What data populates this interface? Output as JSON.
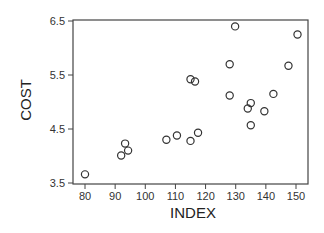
{
  "chart_data": {
    "type": "scatter",
    "title": "",
    "xlabel": "INDEX",
    "ylabel": "COST",
    "xlim": [
      76.5,
      154
    ],
    "ylim": [
      3.5,
      6.5
    ],
    "xticks": [
      80,
      90,
      100,
      110,
      120,
      130,
      140,
      150
    ],
    "yticks": [
      3.5,
      4.5,
      5.5,
      6.5
    ],
    "xtick_labels": [
      "80",
      "90",
      "100",
      "110",
      "120",
      "130",
      "140",
      "150"
    ],
    "ytick_labels": [
      "3.5",
      "4.5",
      "5.5",
      "6.5"
    ],
    "grid": false,
    "legend": null,
    "marker": "open-circle",
    "points": [
      {
        "x": 80,
        "y": 3.66
      },
      {
        "x": 92,
        "y": 4.01
      },
      {
        "x": 93.3,
        "y": 4.23
      },
      {
        "x": 94.3,
        "y": 4.1
      },
      {
        "x": 107,
        "y": 4.3
      },
      {
        "x": 110.5,
        "y": 4.38
      },
      {
        "x": 115,
        "y": 4.28
      },
      {
        "x": 117.5,
        "y": 4.43
      },
      {
        "x": 115,
        "y": 5.42
      },
      {
        "x": 116.5,
        "y": 5.38
      },
      {
        "x": 128,
        "y": 5.7
      },
      {
        "x": 128,
        "y": 5.12
      },
      {
        "x": 129.8,
        "y": 6.4
      },
      {
        "x": 134,
        "y": 4.88
      },
      {
        "x": 135,
        "y": 4.98
      },
      {
        "x": 135,
        "y": 4.57
      },
      {
        "x": 139.5,
        "y": 4.83
      },
      {
        "x": 142.5,
        "y": 5.15
      },
      {
        "x": 147.5,
        "y": 5.67
      },
      {
        "x": 150.5,
        "y": 6.25
      }
    ]
  },
  "colors": {
    "axis": "#444444",
    "marker": "#333333",
    "background": "#ffffff"
  }
}
